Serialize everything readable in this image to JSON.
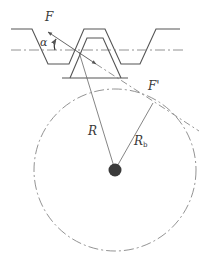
{
  "diagram": {
    "title": "",
    "labels": {
      "force_top": "F",
      "force_right": "F'",
      "pressure_angle": "α",
      "pitch_radius": "R",
      "base_radius_main": "R",
      "base_radius_sub": "b"
    },
    "colors": {
      "line": "#555555",
      "thin_line": "#777777",
      "center_dot": "#3a3a3a",
      "background": "#ffffff"
    },
    "geometry": {
      "rack_top_y": 29,
      "pitch_line_y": 50,
      "gap_bottom_y": 64,
      "gear_tooth_top_y": 38,
      "gear_base_y": 78,
      "circle_center": [
        115,
        170
      ],
      "circle_radius": 81,
      "tangent_point": [
        153,
        103
      ]
    }
  }
}
